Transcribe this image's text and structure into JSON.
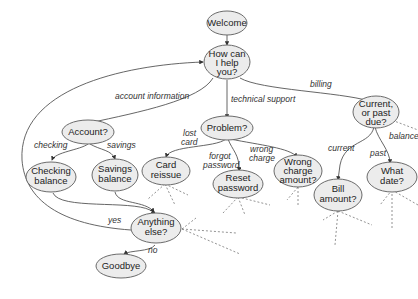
{
  "diagram": {
    "type": "dialogue-flow",
    "nodes": {
      "welcome": "Welcome",
      "help": [
        "How can",
        "I help",
        "you?"
      ],
      "account": "Account?",
      "problem": "Problem?",
      "due": [
        "Current,",
        "or past",
        "due?"
      ],
      "checking": [
        "Checking",
        "balance"
      ],
      "savings": [
        "Savings",
        "balance"
      ],
      "card": [
        "Card",
        "reissue"
      ],
      "reset": [
        "Reset",
        "password"
      ],
      "wrong": [
        "Wrong",
        "charge",
        "amount?"
      ],
      "bill": [
        "Bill",
        "amount?"
      ],
      "date": [
        "What",
        "date?"
      ],
      "anything": [
        "Anything",
        "else?"
      ],
      "goodbye": "Goodbye"
    },
    "edge_labels": {
      "account_information": "account information",
      "technical_support": "technical support",
      "billing": "billing",
      "checking": "checking",
      "savings": "savings",
      "lost_card": [
        "lost",
        "card"
      ],
      "forgot_password": [
        "forgot",
        "password"
      ],
      "wrong_charge": [
        "wrong",
        "charge"
      ],
      "current": "current",
      "past": "past",
      "balance": "balance",
      "yes": "yes",
      "no": "no"
    }
  }
}
